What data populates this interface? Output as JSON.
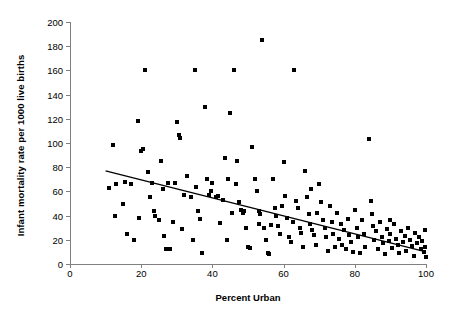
{
  "chart_data": {
    "type": "scatter",
    "title": "",
    "xlabel": "Percent Urban",
    "ylabel": "Infant mortality rate per 1000 live births",
    "xlim": [
      0,
      100
    ],
    "ylim": [
      0,
      200
    ],
    "xticks": [
      0,
      20,
      40,
      60,
      80,
      100
    ],
    "yticks": [
      0,
      20,
      40,
      60,
      80,
      100,
      120,
      140,
      160,
      180,
      200
    ],
    "grid": false,
    "legend": null,
    "marker_color": "#000000",
    "marker_shape": "square",
    "trendline": {
      "type": "linear",
      "color": "#000000",
      "x_start": 10,
      "y_start": 77,
      "x_end": 100,
      "y_end": 10
    },
    "points": [
      [
        11,
        63
      ],
      [
        12,
        98
      ],
      [
        13,
        66
      ],
      [
        15,
        50
      ],
      [
        16,
        25
      ],
      [
        17,
        66
      ],
      [
        18,
        20
      ],
      [
        19,
        118
      ],
      [
        20,
        93
      ],
      [
        20.5,
        95
      ],
      [
        21,
        160
      ],
      [
        22,
        76
      ],
      [
        23,
        67
      ],
      [
        23.5,
        44
      ],
      [
        24,
        40
      ],
      [
        25,
        36
      ],
      [
        25.5,
        85
      ],
      [
        26,
        62
      ],
      [
        27,
        12
      ],
      [
        28,
        12
      ],
      [
        29,
        35
      ],
      [
        30,
        117
      ],
      [
        30.5,
        107
      ],
      [
        31,
        104
      ],
      [
        32,
        57
      ],
      [
        33,
        73
      ],
      [
        34,
        55
      ],
      [
        34.5,
        20
      ],
      [
        35,
        160
      ],
      [
        36,
        44
      ],
      [
        37,
        9
      ],
      [
        38,
        130
      ],
      [
        38.5,
        70
      ],
      [
        39,
        57
      ],
      [
        40,
        67
      ],
      [
        41,
        55
      ],
      [
        41.5,
        56
      ],
      [
        42,
        34
      ],
      [
        43,
        53
      ],
      [
        44,
        20
      ],
      [
        45,
        125
      ],
      [
        46,
        160
      ],
      [
        46.5,
        66
      ],
      [
        47,
        85
      ],
      [
        47.5,
        51
      ],
      [
        48,
        45
      ],
      [
        48.5,
        42
      ],
      [
        49,
        44
      ],
      [
        49.5,
        30
      ],
      [
        50,
        14
      ],
      [
        50.5,
        13
      ],
      [
        51,
        97
      ],
      [
        52,
        70
      ],
      [
        52.5,
        60
      ],
      [
        53,
        44
      ],
      [
        53.5,
        41
      ],
      [
        54,
        185
      ],
      [
        54.5,
        30
      ],
      [
        55,
        20
      ],
      [
        55.5,
        9
      ],
      [
        56,
        8
      ],
      [
        57,
        70
      ],
      [
        57.5,
        46
      ],
      [
        58,
        40
      ],
      [
        58.5,
        31
      ],
      [
        59,
        25
      ],
      [
        60,
        84
      ],
      [
        60.5,
        56
      ],
      [
        61,
        38
      ],
      [
        61.5,
        22
      ],
      [
        62,
        18
      ],
      [
        63,
        160
      ],
      [
        63.5,
        52
      ],
      [
        64,
        46
      ],
      [
        64.5,
        30
      ],
      [
        65,
        26
      ],
      [
        65.5,
        14
      ],
      [
        66,
        77
      ],
      [
        66.5,
        55
      ],
      [
        67,
        41
      ],
      [
        67.5,
        33
      ],
      [
        68,
        28
      ],
      [
        68.5,
        24
      ],
      [
        69,
        16
      ],
      [
        70,
        66
      ],
      [
        70.5,
        51
      ],
      [
        71,
        36
      ],
      [
        71.5,
        30
      ],
      [
        72,
        22
      ],
      [
        72.5,
        11
      ],
      [
        73,
        48
      ],
      [
        73.5,
        35
      ],
      [
        74,
        25
      ],
      [
        75,
        42
      ],
      [
        75.5,
        21
      ],
      [
        76,
        33
      ],
      [
        76.5,
        16
      ],
      [
        77,
        28
      ],
      [
        77.5,
        12
      ],
      [
        78,
        37
      ],
      [
        78.5,
        24
      ],
      [
        79,
        18
      ],
      [
        80,
        45
      ],
      [
        80.5,
        30
      ],
      [
        81,
        22
      ],
      [
        81.5,
        9
      ],
      [
        82,
        36
      ],
      [
        82.5,
        25
      ],
      [
        83,
        14
      ],
      [
        84,
        103
      ],
      [
        84.5,
        52
      ],
      [
        85,
        31
      ],
      [
        85.5,
        20
      ],
      [
        86,
        27
      ],
      [
        86.5,
        12
      ],
      [
        87,
        35
      ],
      [
        87.5,
        22
      ],
      [
        88,
        17
      ],
      [
        88.5,
        8
      ],
      [
        89,
        29
      ],
      [
        89.5,
        19
      ],
      [
        90,
        25
      ],
      [
        90.5,
        13
      ],
      [
        91,
        33
      ],
      [
        91.5,
        21
      ],
      [
        92,
        16
      ],
      [
        92.5,
        9
      ],
      [
        93,
        27
      ],
      [
        93.5,
        18
      ],
      [
        94,
        23
      ],
      [
        94.5,
        11
      ],
      [
        95,
        30
      ],
      [
        95.5,
        20
      ],
      [
        96,
        15
      ],
      [
        96.5,
        7
      ],
      [
        97,
        26
      ],
      [
        97.5,
        17
      ],
      [
        98,
        22
      ],
      [
        98.5,
        12
      ],
      [
        99,
        19
      ],
      [
        99.3,
        10
      ],
      [
        99.6,
        28
      ],
      [
        99.8,
        14
      ],
      [
        100,
        6
      ],
      [
        44.5,
        70
      ],
      [
        56.5,
        32
      ],
      [
        67.8,
        62
      ],
      [
        31.5,
        29
      ],
      [
        43.5,
        88
      ],
      [
        53.2,
        33
      ],
      [
        62.5,
        35
      ],
      [
        74.5,
        14
      ],
      [
        84.8,
        41
      ],
      [
        35.5,
        64
      ],
      [
        27.5,
        67
      ],
      [
        22.5,
        55
      ],
      [
        12.5,
        40
      ],
      [
        15.5,
        68
      ],
      [
        19.5,
        38
      ],
      [
        29.5,
        67
      ],
      [
        39.5,
        60
      ],
      [
        59.5,
        48
      ],
      [
        69.5,
        42
      ],
      [
        79.5,
        10
      ],
      [
        89.8,
        36
      ],
      [
        45.5,
        42
      ],
      [
        36.5,
        37
      ],
      [
        26.5,
        23
      ]
    ]
  }
}
